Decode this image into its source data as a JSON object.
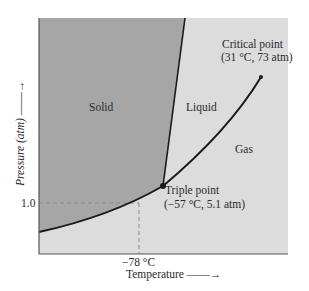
{
  "diagram": {
    "colors": {
      "solid_region": "#a6a6a6",
      "liquid_gas_region": "#dcdcdc",
      "curve": "#1a1a1a",
      "dashed": "#8a8a8a",
      "axis": "#555555"
    },
    "regions": {
      "solid": "Solid",
      "liquid": "Liquid",
      "gas": "Gas"
    },
    "points": {
      "critical": {
        "name": "Critical point",
        "values": "(31 °C, 73 atm)",
        "temperature_c": 31,
        "pressure_atm": 73
      },
      "triple": {
        "name": "Triple point",
        "values": "(−57 °C, 5.1 atm)",
        "temperature_c": -57,
        "pressure_atm": 5.1
      }
    },
    "axes": {
      "x_label": "Temperature",
      "x_arrow": "——→",
      "y_label": "Pressure (atm)",
      "y_arrow": "——→",
      "y_tick": "1.0",
      "x_tick": "−78 °C"
    }
  }
}
